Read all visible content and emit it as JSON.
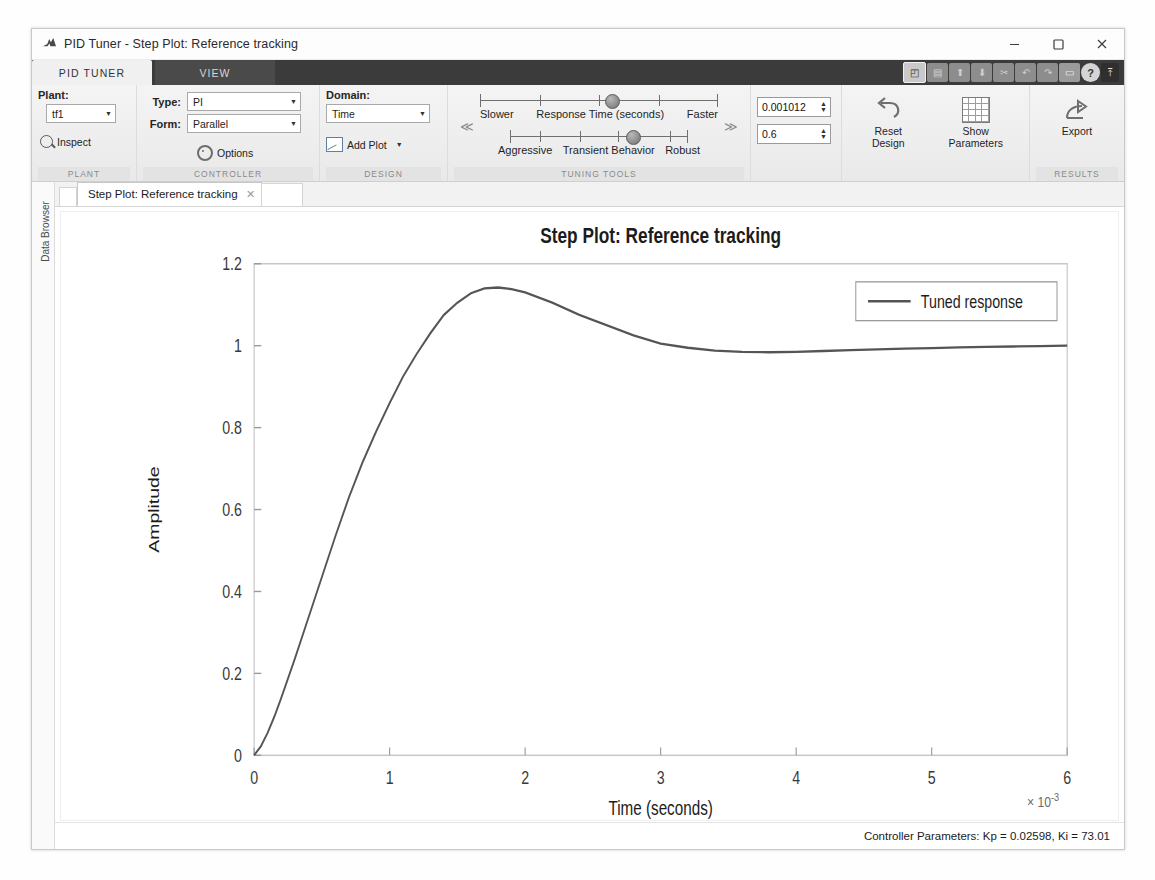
{
  "window": {
    "title": "PID Tuner - Step Plot: Reference tracking",
    "logo_icon": "matlab-logo-icon",
    "minimize_label": "─",
    "maximize_label": "□",
    "close_label": "✕"
  },
  "ribbon": {
    "tabs": [
      {
        "label": "PID TUNER",
        "active": true
      },
      {
        "label": "VIEW",
        "active": false
      }
    ],
    "quick_access": [
      {
        "icon": "matlab-app-icon",
        "label": "◰"
      },
      {
        "icon": "save-icon",
        "label": "▤"
      },
      {
        "icon": "open-icon",
        "label": "⬆"
      },
      {
        "icon": "import-icon",
        "label": "⬇"
      },
      {
        "icon": "cut-icon",
        "label": "✂"
      },
      {
        "icon": "undo-icon",
        "label": "↶"
      },
      {
        "icon": "redo-icon",
        "label": "↷"
      },
      {
        "icon": "layout-icon",
        "label": "▭"
      },
      {
        "icon": "help-icon",
        "label": "?"
      },
      {
        "icon": "pin-ribbon-icon",
        "label": "⤒"
      }
    ],
    "groups": {
      "plant": {
        "label": "PLANT",
        "caption": "Plant:",
        "combo_value": "tf1",
        "inspect_label": "Inspect"
      },
      "controller": {
        "label": "CONTROLLER",
        "type_caption": "Type:",
        "type_value": "PI",
        "form_caption": "Form:",
        "form_value": "Parallel",
        "options_label": "Options"
      },
      "design": {
        "label": "DESIGN",
        "caption": "Domain:",
        "domain_value": "Time",
        "add_plot_label": "Add Plot"
      },
      "tuning": {
        "label": "TUNING TOOLS",
        "collapse_left": "≪",
        "collapse_right": "≫",
        "slider1": {
          "left_label": "Slower",
          "center_label": "Response Time (seconds)",
          "right_label": "Faster",
          "thumb_percent": 55
        },
        "slider2": {
          "left_label": "Aggressive",
          "center_label": "Transient Behavior",
          "right_label": "Robust",
          "thumb_percent": 64
        },
        "response_time_value": "0.001012",
        "transient_behavior_value": "0.6",
        "reset_design_label": "Reset\nDesign",
        "reset_design_line1": "Reset",
        "reset_design_line2": "Design",
        "show_parameters_line1": "Show",
        "show_parameters_line2": "Parameters"
      },
      "results": {
        "label": "RESULTS",
        "export_label": "Export"
      }
    }
  },
  "sidebar": {
    "data_browser_label": "Data Browser"
  },
  "document": {
    "tab_label": "Step Plot: Reference tracking",
    "close_label": "✕"
  },
  "status": {
    "controller_parameters": "Controller Parameters: Kp = 0.02598, Ki = 73.01"
  },
  "chart_data": {
    "type": "line",
    "title": "Step Plot: Reference tracking",
    "xlabel": "Time (seconds)",
    "ylabel": "Amplitude",
    "x_exponent_label": "× 10",
    "x_exponent_sup": "-3",
    "xlim": [
      0,
      6
    ],
    "ylim": [
      0,
      1.2
    ],
    "xticks": [
      0,
      1,
      2,
      3,
      4,
      5,
      6
    ],
    "xticklabels": [
      "0",
      "1",
      "2",
      "3",
      "4",
      "5",
      "6"
    ],
    "yticks": [
      0,
      0.2,
      0.4,
      0.6,
      0.8,
      1,
      1.2
    ],
    "yticklabels": [
      "0",
      "0.2",
      "0.4",
      "0.6",
      "0.8",
      "1",
      "1.2"
    ],
    "grid": false,
    "legend_position": "top-right",
    "legend": [
      "Tuned response"
    ],
    "line_color": "#555555",
    "series": [
      {
        "name": "Tuned response",
        "x": [
          0,
          0.05,
          0.1,
          0.15,
          0.2,
          0.3,
          0.4,
          0.5,
          0.6,
          0.7,
          0.8,
          0.9,
          1.0,
          1.1,
          1.2,
          1.3,
          1.4,
          1.5,
          1.6,
          1.7,
          1.8,
          1.9,
          2.0,
          2.2,
          2.4,
          2.6,
          2.8,
          3.0,
          3.2,
          3.4,
          3.6,
          3.8,
          4.0,
          4.2,
          4.4,
          4.6,
          4.8,
          5.0,
          5.2,
          5.4,
          5.6,
          5.8,
          6.0
        ],
        "y": [
          0,
          0.022,
          0.055,
          0.095,
          0.14,
          0.235,
          0.335,
          0.435,
          0.535,
          0.63,
          0.715,
          0.79,
          0.86,
          0.925,
          0.98,
          1.03,
          1.075,
          1.105,
          1.128,
          1.14,
          1.142,
          1.138,
          1.13,
          1.105,
          1.075,
          1.05,
          1.025,
          1.005,
          0.995,
          0.988,
          0.985,
          0.984,
          0.985,
          0.987,
          0.989,
          0.991,
          0.993,
          0.994,
          0.996,
          0.997,
          0.998,
          0.999,
          1.0
        ]
      }
    ]
  }
}
